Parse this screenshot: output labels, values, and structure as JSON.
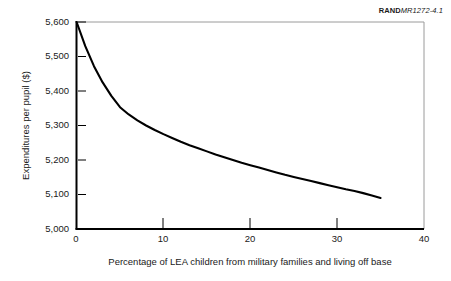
{
  "figure": {
    "identifier_mark": "RAND",
    "identifier_number": "MR1272-4.1"
  },
  "chart_data": {
    "type": "line",
    "title": "",
    "subtitle": "",
    "xlabel": "Percentage of LEA children from military families and living off base",
    "ylabel": "Expenditures per pupil ($)",
    "xlim": [
      0,
      40
    ],
    "ylim": [
      5000,
      5600
    ],
    "xticks": [
      0,
      10,
      20,
      30,
      40
    ],
    "yticks": [
      5000,
      5100,
      5200,
      5300,
      5400,
      5500,
      5600
    ],
    "xtick_labels": [
      "0",
      "10",
      "20",
      "30",
      "40"
    ],
    "ytick_labels": [
      "5,000",
      "5,100",
      "5,200",
      "5,300",
      "5,400",
      "5,500",
      "5,600"
    ],
    "grid": false,
    "legend": null,
    "legend_position": "none",
    "line_color": "#000000",
    "line_width": 2,
    "series": [
      {
        "name": "Expenditures per pupil",
        "x": [
          0,
          1,
          2,
          3,
          4,
          5,
          6,
          7,
          8,
          9,
          10,
          11,
          12,
          13,
          14,
          15,
          16,
          17,
          18,
          19,
          20,
          21,
          22,
          23,
          24,
          25,
          26,
          27,
          28,
          29,
          30,
          31,
          32,
          33,
          34,
          35
        ],
        "values": [
          5600,
          5530,
          5472,
          5425,
          5386,
          5353,
          5332,
          5315,
          5300,
          5287,
          5275,
          5264,
          5253,
          5243,
          5234,
          5225,
          5216,
          5208,
          5200,
          5192,
          5185,
          5178,
          5171,
          5164,
          5157,
          5151,
          5145,
          5139,
          5133,
          5127,
          5121,
          5115,
          5110,
          5104,
          5097,
          5090
        ]
      }
    ],
    "data_range_note": "curve spans x = 0 to x = 35"
  },
  "ticks": {
    "y": [
      {
        "label": "5,600",
        "value": 5600
      },
      {
        "label": "5,500",
        "value": 5500
      },
      {
        "label": "5,400",
        "value": 5400
      },
      {
        "label": "5,300",
        "value": 5300
      },
      {
        "label": "5,200",
        "value": 5200
      },
      {
        "label": "5,100",
        "value": 5100
      },
      {
        "label": "5,000",
        "value": 5000
      }
    ],
    "x": [
      {
        "label": "0",
        "value": 0
      },
      {
        "label": "10",
        "value": 10
      },
      {
        "label": "20",
        "value": 20
      },
      {
        "label": "30",
        "value": 30
      },
      {
        "label": "40",
        "value": 40
      }
    ]
  }
}
